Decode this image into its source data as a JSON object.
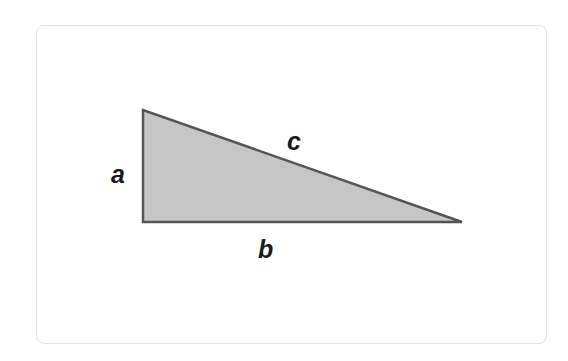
{
  "diagram": {
    "colors": {
      "fill": "#c6c6c6",
      "stroke": "#555555",
      "label": "#1a1a1a",
      "frame_border": "#e2e2e2"
    },
    "vertices": {
      "top": [
        143,
        110
      ],
      "right_angle": [
        143,
        222
      ],
      "right": [
        462,
        222
      ]
    },
    "labels": {
      "a": "a",
      "b": "b",
      "c": "c"
    },
    "label_positions": {
      "a": [
        111,
        183
      ],
      "b": [
        258,
        258
      ],
      "c": [
        287,
        150
      ]
    }
  }
}
